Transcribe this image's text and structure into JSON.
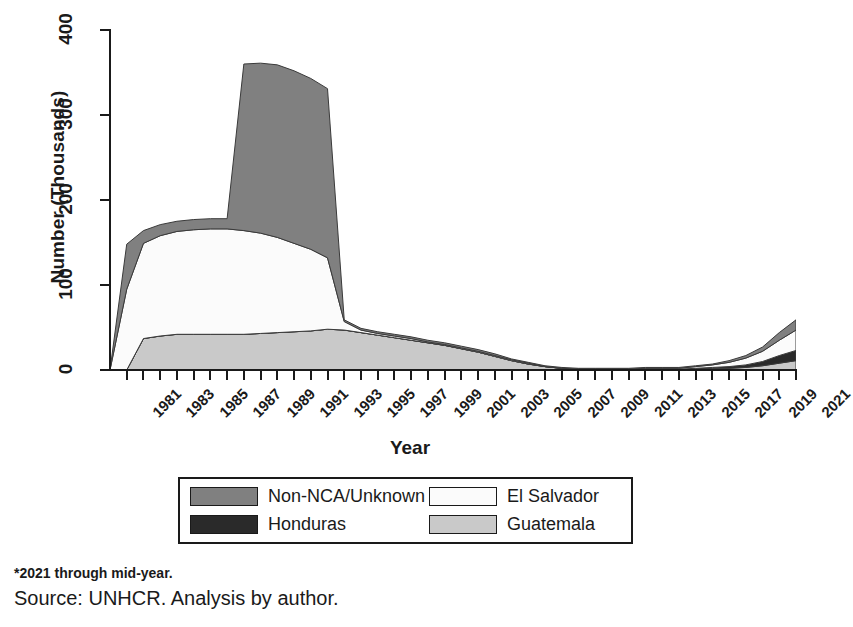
{
  "chart_data": {
    "type": "area",
    "stacked": true,
    "title": "",
    "xlabel": "Year",
    "ylabel": "Number (Thousands)",
    "xlim": [
      1980,
      2021
    ],
    "ylim": [
      0,
      400
    ],
    "yticks": [
      0,
      100,
      200,
      300,
      400
    ],
    "ytick_labels": [
      "0",
      "100",
      "200",
      "300",
      "400"
    ],
    "xtick_labels": [
      "1981",
      "1983",
      "1985",
      "1987",
      "1989",
      "1991",
      "1993",
      "1995",
      "1997",
      "1999",
      "2001",
      "2003",
      "2005",
      "2007",
      "2009",
      "2011",
      "2013",
      "2015",
      "2017",
      "2019",
      "2021"
    ],
    "grid": false,
    "legend_position": "below-plot",
    "x": [
      1980,
      1981,
      1982,
      1983,
      1984,
      1985,
      1986,
      1987,
      1988,
      1989,
      1990,
      1991,
      1992,
      1993,
      1994,
      1995,
      1996,
      1997,
      1998,
      1999,
      2000,
      2001,
      2002,
      2003,
      2004,
      2005,
      2006,
      2007,
      2008,
      2009,
      2010,
      2011,
      2012,
      2013,
      2014,
      2015,
      2016,
      2017,
      2018,
      2019,
      2020,
      2021
    ],
    "series": [
      {
        "name": "Guatemala",
        "color": "#c9c9c9",
        "stack_order": 1,
        "values": [
          0,
          0,
          37,
          40,
          42,
          42,
          42,
          42,
          42,
          43,
          44,
          45,
          46,
          48,
          47,
          44,
          41,
          38,
          35,
          32,
          29,
          25,
          21,
          16,
          11,
          7,
          4,
          2,
          1,
          1,
          1,
          1,
          1,
          1,
          1,
          1,
          2,
          2,
          3,
          5,
          8,
          11
        ]
      },
      {
        "name": "Honduras",
        "color": "#2a2a2a",
        "stack_order": 2,
        "values": [
          0,
          0,
          0,
          0,
          0,
          0,
          0,
          0,
          0,
          0,
          0,
          0,
          0,
          0,
          0,
          0,
          0,
          0,
          0,
          0,
          0,
          0,
          0,
          0,
          0,
          0,
          0,
          0,
          0,
          0,
          0,
          0,
          0,
          0,
          0,
          1,
          1,
          2,
          3,
          5,
          9,
          12
        ]
      },
      {
        "name": "El Salvador",
        "color": "#fbfbfb",
        "stack_order": 3,
        "values": [
          0,
          95,
          112,
          118,
          121,
          123,
          124,
          124,
          122,
          118,
          112,
          104,
          96,
          84,
          10,
          3,
          2,
          2,
          2,
          1,
          1,
          1,
          1,
          1,
          1,
          1,
          0,
          0,
          0,
          0,
          0,
          0,
          1,
          1,
          1,
          2,
          3,
          5,
          8,
          12,
          18,
          24
        ]
      },
      {
        "name": "Non-NCA/Unknown",
        "color": "#808080",
        "stack_order": 4,
        "values": [
          0,
          53,
          15,
          13,
          12,
          12,
          12,
          12,
          196,
          200,
          203,
          203,
          201,
          199,
          2,
          2,
          2,
          2,
          2,
          2,
          2,
          2,
          2,
          2,
          1,
          1,
          1,
          1,
          1,
          1,
          1,
          1,
          1,
          1,
          1,
          1,
          1,
          2,
          3,
          5,
          9,
          12
        ]
      }
    ],
    "stack_totals": [
      0,
      148,
      164,
      171,
      175,
      177,
      178,
      178,
      360,
      361,
      359,
      352,
      343,
      331,
      59,
      49,
      45,
      42,
      39,
      35,
      32,
      28,
      24,
      19,
      13,
      9,
      5,
      3,
      2,
      2,
      2,
      2,
      3,
      3,
      3,
      5,
      7,
      11,
      17,
      27,
      44,
      59
    ]
  },
  "axis": {
    "y_title": "Number (Thousands)",
    "x_title": "Year"
  },
  "legend": {
    "entries": [
      {
        "label": "Non-NCA/Unknown",
        "color": "#808080"
      },
      {
        "label": "El Salvador",
        "color": "#fbfbfb"
      },
      {
        "label": "Honduras",
        "color": "#2a2a2a"
      },
      {
        "label": "Guatemala",
        "color": "#c9c9c9"
      }
    ]
  },
  "notes": {
    "footnote": "*2021 through mid-year.",
    "source": "Source: UNHCR. Analysis by author."
  }
}
